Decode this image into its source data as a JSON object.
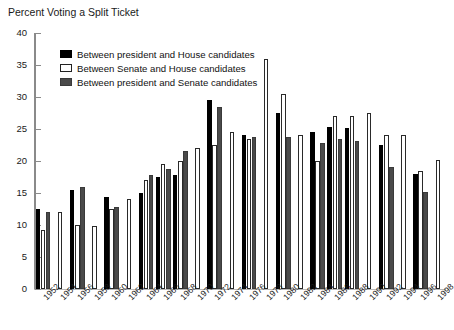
{
  "chart_title": "Percent Voting a Split Ticket",
  "axis": {
    "y_ticks": [
      0,
      5,
      10,
      15,
      20,
      25,
      30,
      35,
      40
    ],
    "ylim": [
      0,
      40
    ],
    "ylabel": "",
    "xlabel": ""
  },
  "legend": {
    "position": "top-left-inside",
    "entries": [
      {
        "key": "pres_house",
        "label": "Between president and House candidates",
        "swatch": "s0",
        "color": "#000000"
      },
      {
        "key": "senate_house",
        "label": "Between Senate and House candidates",
        "swatch": "s1",
        "color": "#ffffff"
      },
      {
        "key": "pres_senate",
        "label": "Between president and Senate candidates",
        "swatch": "s2",
        "color": "#4a4a4a"
      }
    ]
  },
  "chart_data": {
    "type": "bar",
    "title": "Percent Voting a Split Ticket",
    "xlabel": "",
    "ylabel": "",
    "ylim": [
      0,
      40
    ],
    "grid": false,
    "legend_position": "top-left-inside",
    "categories": [
      "1952",
      "1954",
      "1956",
      "1958",
      "1960",
      "1962",
      "1964",
      "1966",
      "1968",
      "1970",
      "1972",
      "1974",
      "1976",
      "1978",
      "1980",
      "1982",
      "1984",
      "1986",
      "1988",
      "1990",
      "1992",
      "1994",
      "1996",
      "1998"
    ],
    "series": [
      {
        "name": "Between president and House candidates",
        "color": "#000000",
        "values": [
          12.5,
          null,
          15.5,
          null,
          14.3,
          null,
          15.0,
          17.5,
          17.8,
          null,
          29.5,
          null,
          24.0,
          null,
          27.5,
          null,
          24.5,
          25.3,
          25.2,
          null,
          22.5,
          null,
          18.0,
          null
        ]
      },
      {
        "name": "Between Senate and House candidates",
        "color": "#ffffff",
        "values": [
          9.2,
          12.0,
          10.0,
          9.9,
          12.5,
          14.0,
          17.0,
          19.5,
          20.0,
          22.0,
          22.5,
          24.5,
          23.5,
          36.0,
          30.5,
          24.0,
          20.0,
          27.0,
          27.0,
          27.5,
          24.0,
          24.0,
          18.5,
          20.2
        ]
      },
      {
        "name": "Between president and Senate candidates",
        "color": "#4a4a4a",
        "values": [
          12.0,
          null,
          16.0,
          null,
          12.8,
          null,
          17.8,
          18.8,
          21.5,
          null,
          28.5,
          null,
          23.8,
          null,
          23.7,
          null,
          22.8,
          23.5,
          23.2,
          null,
          19.0,
          null,
          15.2,
          null
        ]
      }
    ]
  }
}
